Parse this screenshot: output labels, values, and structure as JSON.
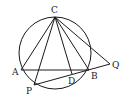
{
  "diagram": {
    "type": "geometry",
    "circle": {
      "cx": 55,
      "cy": 53,
      "r": 36
    },
    "points": {
      "C": {
        "x": 55,
        "y": 17,
        "label": "C",
        "lx": 51,
        "ly": 13
      },
      "A": {
        "x": 21,
        "y": 70,
        "label": "A",
        "lx": 12,
        "ly": 75
      },
      "B": {
        "x": 89,
        "y": 70,
        "label": "B",
        "lx": 91,
        "ly": 79
      },
      "D": {
        "x": 72,
        "y": 74,
        "label": "D",
        "lx": 68,
        "ly": 84
      },
      "P": {
        "x": 34,
        "y": 85,
        "label": "P",
        "lx": 26,
        "ly": 94
      },
      "Q": {
        "x": 110,
        "y": 64,
        "label": "Q",
        "lx": 112,
        "ly": 68
      }
    },
    "segments": [
      [
        "C",
        "A"
      ],
      [
        "C",
        "P"
      ],
      [
        "C",
        "D"
      ],
      [
        "C",
        "B"
      ],
      [
        "C",
        "Q"
      ],
      [
        "A",
        "B"
      ],
      [
        "P",
        "Q"
      ]
    ]
  }
}
